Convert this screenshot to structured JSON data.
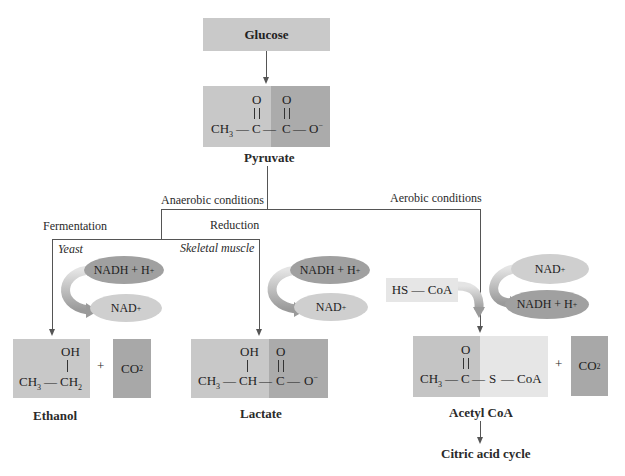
{
  "colors": {
    "light_gray": "#cccccc",
    "mid_gray": "#b0b0b0",
    "dark_gray": "#a6a6a6",
    "very_light_gray": "#e6e6e6",
    "oval_dark": "#a0a0a0",
    "oval_light": "#cfcfcf",
    "line": "#555555"
  },
  "glucose": {
    "label": "Glucose"
  },
  "pyruvate": {
    "name": "Pyruvate",
    "o1": "O",
    "o2": "O",
    "ch3": "CH",
    "ch3_sub": "3",
    "c1": "C",
    "c2": "C",
    "om": "O",
    "om_sup": "−"
  },
  "branches": {
    "anaerobic": "Anaerobic conditions",
    "aerobic": "Aerobic conditions",
    "fermentation": "Fermentation",
    "reduction": "Reduction",
    "yeast": "Yeast",
    "skeletal_muscle": "Skeletal muscle"
  },
  "cofactors": {
    "nadh": "NADH + H",
    "nadh_sup": "+",
    "nad": "NAD",
    "nad_sup": "+"
  },
  "ethanol": {
    "name": "Ethanol",
    "oh": "OH",
    "ch3": "CH",
    "ch3_sub": "3",
    "ch2": "CH",
    "ch2_sub": "2"
  },
  "plus": "+",
  "co2": {
    "c": "CO",
    "sub": "2"
  },
  "lactate": {
    "name": "Lactate",
    "oh": "OH",
    "o": "O",
    "ch3": "CH",
    "ch3_sub": "3",
    "ch": "CH",
    "c": "C",
    "om": "O",
    "om_sup": "−"
  },
  "hscoa": {
    "label": "HS — CoA"
  },
  "acetylcoa": {
    "name": "Acetyl CoA",
    "o": "O",
    "ch3": "CH",
    "ch3_sub": "3",
    "c": "C",
    "s": "S",
    "coa": "CoA"
  },
  "citric": {
    "label": "Citric acid cycle"
  }
}
